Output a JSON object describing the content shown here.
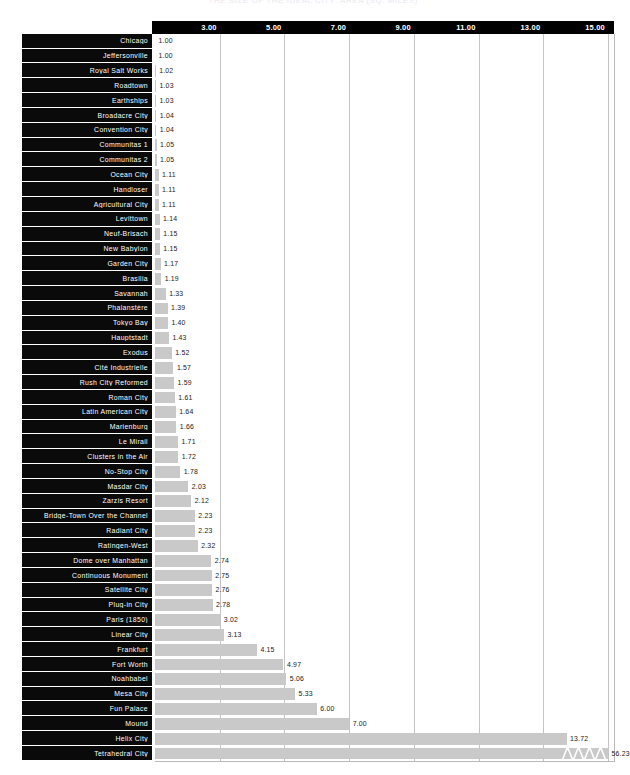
{
  "chart_data": {
    "type": "bar",
    "orientation": "horizontal",
    "title": "THE SIZE OF THE IDEAL CITY: AREA (SQ. MILES)",
    "xlabel": "",
    "ylabel": "",
    "grid": true,
    "legend": null,
    "xlim": [
      1.0,
      15.0
    ],
    "xticks": [
      "3.00",
      "5.00",
      "7.00",
      "9.00",
      "11.00",
      "13.00",
      "15.00"
    ],
    "xtick_values": [
      3,
      5,
      7,
      9,
      11,
      13,
      15
    ],
    "axis_break": {
      "present": true,
      "applies_to": "Tetrahedral City",
      "marker": "zigzag",
      "note": "bar truncated; true value 56.23 exceeds axis maximum"
    },
    "categories": [
      "Chicago",
      "Jeffersonville",
      "Royal Salt Works",
      "Roadtown",
      "Earthships",
      "Broadacre City",
      "Convention City",
      "Communitas 1",
      "Communitas 2",
      "Ocean City",
      "Handloser",
      "Agricultural City",
      "Levittown",
      "Neuf-Brisach",
      "New Babylon",
      "Garden City",
      "Brasilia",
      "Savannah",
      "Phalanstère",
      "Tokyo Bay",
      "Hauptstadt",
      "Exodus",
      "Cité Industrielle",
      "Rush City Reformed",
      "Roman City",
      "Latin American City",
      "Marienburg",
      "Le Mirail",
      "Clusters in the Air",
      "No-Stop City",
      "Masdar City",
      "Zarzis Resort",
      "Bridge-Town Over the Channel",
      "Radiant City",
      "Ratingen-West",
      "Dome over Manhattan",
      "Continuous Monument",
      "Satellite City",
      "Plug-in City",
      "Paris (1850)",
      "Linear City",
      "Frankfurt",
      "Fort Worth",
      "Noahbabel",
      "Mesa City",
      "Fun Palace",
      "Mound",
      "Helix City",
      "Tetrahedral City"
    ],
    "values": [
      1.0,
      1.0,
      1.02,
      1.03,
      1.03,
      1.04,
      1.04,
      1.05,
      1.05,
      1.11,
      1.11,
      1.11,
      1.14,
      1.15,
      1.15,
      1.17,
      1.19,
      1.33,
      1.39,
      1.4,
      1.43,
      1.52,
      1.57,
      1.59,
      1.61,
      1.64,
      1.66,
      1.71,
      1.72,
      1.78,
      2.03,
      2.12,
      2.23,
      2.23,
      2.32,
      2.74,
      2.75,
      2.76,
      2.78,
      3.02,
      3.13,
      4.15,
      4.97,
      5.06,
      5.33,
      6.0,
      7.0,
      13.72,
      56.23
    ],
    "value_labels": [
      "1.00",
      "1.00",
      "1.02",
      "1.03",
      "1.03",
      "1.04",
      "1.04",
      "1.05",
      "1.05",
      "1.11",
      "1.11",
      "1.11",
      "1.14",
      "1.15",
      "1.15",
      "1.17",
      "1.19",
      "1.33",
      "1.39",
      "1.40",
      "1.43",
      "1.52",
      "1.57",
      "1.59",
      "1.61",
      "1.64",
      "1.66",
      "1.71",
      "1.72",
      "1.78",
      "2.03",
      "2.12",
      "2.23",
      "2.23",
      "2.32",
      "2.74",
      "2.75",
      "2.76",
      "2.78",
      "3.02",
      "3.13",
      "4.15",
      "4.97",
      "5.06",
      "5.33",
      "6.00",
      "7.00",
      "13.72",
      "56.23"
    ],
    "colors": {
      "bar": "#c9c9c9",
      "label_panel": "#0a0a0a",
      "label_text": "#ffffff",
      "value_text": "#1a1a1a",
      "gridline": "#c4c4c4",
      "header": "#000000",
      "background": "#ffffff"
    }
  }
}
